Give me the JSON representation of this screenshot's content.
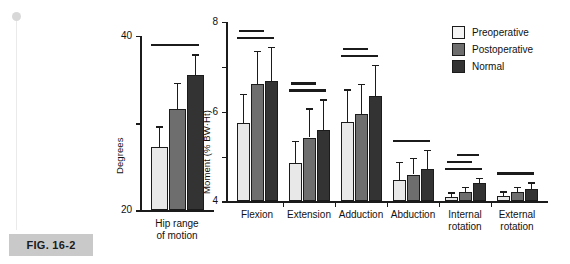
{
  "figure": {
    "caption": "FIG. 16-2"
  },
  "legend": {
    "position": "top-right",
    "entries": [
      {
        "label": "Preoperative",
        "color": "#f4f4f4"
      },
      {
        "label": "Postoperative",
        "color": "#6e6e6e"
      },
      {
        "label": "Normal",
        "color": "#333333"
      }
    ]
  },
  "chart_data": [
    {
      "id": "hip-range-of-motion",
      "type": "bar",
      "title": "",
      "xlabel": "",
      "ylabel": "Degrees",
      "ylim": [
        0,
        40
      ],
      "yticks": [
        0,
        20,
        40
      ],
      "ytick_labels": [
        "0",
        "20",
        "40"
      ],
      "grid": false,
      "categories": [
        "Hip range\nof motion"
      ],
      "series": [
        {
          "name": "Preoperative",
          "values": [
            14.5
          ],
          "errors_upper": [
            19.3
          ]
        },
        {
          "name": "Postoperative",
          "values": [
            23.3
          ],
          "errors_upper": [
            29.2
          ]
        },
        {
          "name": "Normal",
          "values": [
            31.0
          ],
          "errors_upper": [
            35.8
          ]
        }
      ],
      "significance_bars": [
        {
          "label": "",
          "note": "Preoperative vs Normal"
        },
        {
          "label": "",
          "note": "Postoperative vs Normal"
        },
        {
          "label": "",
          "note": "Preoperative vs Postoperative"
        }
      ]
    },
    {
      "id": "hip-moments",
      "type": "bar",
      "title": "",
      "xlabel": "",
      "ylabel": "Moment (% BW·Ht)",
      "ylim": [
        0,
        8
      ],
      "yticks": [
        0,
        2,
        4,
        6,
        8
      ],
      "ytick_labels": [
        "0",
        "2",
        "4",
        "6",
        "8"
      ],
      "grid": false,
      "categories": [
        "Flexion",
        "Extension",
        "Adduction",
        "Abduction",
        "Internal\nrotation",
        "External\nrotation"
      ],
      "series": [
        {
          "name": "Preoperative",
          "values": [
            3.5,
            1.7,
            3.55,
            0.95,
            0.2,
            0.25
          ],
          "errors_upper": [
            4.8,
            2.7,
            5.0,
            1.75,
            0.4,
            0.45
          ]
        },
        {
          "name": "Postoperative",
          "values": [
            5.25,
            2.85,
            3.9,
            1.2,
            0.4,
            0.4
          ],
          "errors_upper": [
            6.7,
            4.15,
            5.25,
            1.95,
            0.65,
            0.65
          ]
        },
        {
          "name": "Normal",
          "values": [
            5.35,
            3.2,
            4.7,
            1.45,
            0.8,
            0.55
          ],
          "errors_upper": [
            6.9,
            4.55,
            6.1,
            2.3,
            1.05,
            0.85
          ]
        }
      ],
      "significance_bars": [
        {
          "group": "Flexion",
          "count": 2
        },
        {
          "group": "Extension",
          "count": 2
        },
        {
          "group": "Adduction",
          "count": 2
        },
        {
          "group": "Abduction",
          "count": 1
        },
        {
          "group": "Internal rotation",
          "count": 3
        },
        {
          "group": "External rotation",
          "count": 1
        }
      ]
    }
  ]
}
